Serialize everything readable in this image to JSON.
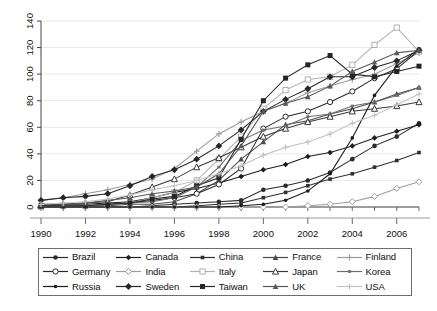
{
  "chart_data": {
    "type": "line",
    "title": "",
    "subtitle": "",
    "xlabel": "",
    "ylabel": "",
    "xlim": [
      1990,
      2007
    ],
    "ylim": [
      0,
      140
    ],
    "ytick_step": 20,
    "xtick_step": 2,
    "grid": true,
    "legend_position": "bottom",
    "yticks": [
      "0",
      "20",
      "40",
      "60",
      "80",
      "100",
      "120",
      "140"
    ],
    "xticks": [
      "1990",
      "1992",
      "1994",
      "1996",
      "1998",
      "2000",
      "2002",
      "2004",
      "2006"
    ],
    "x": [
      1990,
      1991,
      1992,
      1993,
      1994,
      1995,
      1996,
      1997,
      1998,
      1999,
      2000,
      2001,
      2002,
      2003,
      2004,
      2005,
      2006,
      2007
    ],
    "series": [
      {
        "name": "Brazil",
        "marker": "filled-circle",
        "color": "#2b2b2b",
        "values": [
          0,
          0,
          0,
          0,
          0,
          1,
          2,
          3,
          4,
          5,
          13,
          16,
          20,
          26,
          36,
          46,
          53,
          63
        ]
      },
      {
        "name": "Canada",
        "marker": "filled-diamond",
        "color": "#1f1f1f",
        "values": [
          2,
          2,
          2,
          3,
          4,
          7,
          11,
          14,
          18,
          23,
          28,
          32,
          38,
          41,
          46,
          52,
          57,
          62
        ]
      },
      {
        "name": "China",
        "marker": "filled-square-small",
        "color": "#303030",
        "values": [
          0,
          0,
          0,
          0,
          0,
          0,
          0,
          1,
          2,
          3,
          7,
          11,
          16,
          21,
          25,
          30,
          35,
          41
        ]
      },
      {
        "name": "France",
        "marker": "filled-triangle",
        "color": "#4a4a4a",
        "values": [
          0,
          1,
          1,
          1,
          2,
          2,
          4,
          10,
          20,
          36,
          49,
          62,
          65,
          70,
          74,
          79,
          85,
          90
        ]
      },
      {
        "name": "Finland",
        "marker": "plus",
        "color": "#9a9a9a",
        "values": [
          5,
          7,
          10,
          13,
          17,
          21,
          29,
          42,
          55,
          64,
          72,
          78,
          86,
          91,
          96,
          100,
          108,
          116
        ]
      },
      {
        "name": "Germany",
        "marker": "open-circle",
        "color": "#2a2a2a",
        "values": [
          0,
          1,
          1,
          2,
          3,
          5,
          7,
          10,
          17,
          29,
          59,
          68,
          72,
          79,
          87,
          97,
          104,
          118
        ]
      },
      {
        "name": "India",
        "marker": "open-diamond",
        "color": "#9d9d9d",
        "values": [
          0,
          0,
          0,
          0,
          0,
          0,
          0,
          0,
          0,
          0,
          0,
          0,
          1,
          2,
          4,
          8,
          14,
          19
        ]
      },
      {
        "name": "Italy",
        "marker": "open-square",
        "color": "#b0b0b0",
        "values": [
          0,
          1,
          1,
          2,
          3,
          7,
          11,
          20,
          36,
          53,
          74,
          88,
          96,
          98,
          107,
          122,
          135,
          117
        ]
      },
      {
        "name": "Japan",
        "marker": "open-triangle",
        "color": "#3a3a3a",
        "values": [
          1,
          2,
          3,
          4,
          9,
          15,
          21,
          30,
          37,
          45,
          53,
          59,
          64,
          68,
          72,
          74,
          76,
          79
        ]
      },
      {
        "name": "Korea",
        "marker": "small-dash",
        "color": "#6d6d6d",
        "values": [
          0,
          1,
          1,
          2,
          3,
          4,
          7,
          15,
          30,
          50,
          58,
          61,
          68,
          70,
          76,
          79,
          84,
          90
        ]
      },
      {
        "name": "Russia",
        "marker": "filled-circle-small",
        "color": "#1c1c1c",
        "values": [
          0,
          0,
          0,
          0,
          0,
          0,
          0,
          0,
          0,
          1,
          2,
          5,
          12,
          25,
          52,
          84,
          106,
          119
        ]
      },
      {
        "name": "Sweden",
        "marker": "filled-diamond-large",
        "color": "#262626",
        "values": [
          5,
          7,
          8,
          10,
          16,
          23,
          28,
          36,
          46,
          58,
          72,
          81,
          89,
          98,
          98,
          105,
          110,
          118
        ]
      },
      {
        "name": "Taiwan",
        "marker": "filled-square",
        "color": "#252525",
        "values": [
          1,
          1,
          1,
          2,
          3,
          6,
          8,
          16,
          22,
          51,
          80,
          97,
          107,
          114,
          100,
          98,
          102,
          106
        ]
      },
      {
        "name": "UK",
        "marker": "filled-triangle-gray",
        "color": "#585858",
        "values": [
          2,
          2,
          3,
          5,
          7,
          10,
          12,
          15,
          25,
          46,
          72,
          78,
          83,
          91,
          102,
          109,
          116,
          118
        ]
      },
      {
        "name": "USA",
        "marker": "light-plus",
        "color": "#c2c2c2",
        "values": [
          2,
          3,
          4,
          6,
          9,
          13,
          16,
          20,
          25,
          31,
          39,
          45,
          49,
          55,
          63,
          69,
          77,
          85
        ]
      }
    ]
  },
  "legend": {
    "items": [
      {
        "label": "Brazil"
      },
      {
        "label": "Canada"
      },
      {
        "label": "China"
      },
      {
        "label": "France"
      },
      {
        "label": "Finland"
      },
      {
        "label": "Germany"
      },
      {
        "label": "India"
      },
      {
        "label": "Italy"
      },
      {
        "label": "Japan"
      },
      {
        "label": "Korea"
      },
      {
        "label": "Russia"
      },
      {
        "label": "Sweden"
      },
      {
        "label": "Taiwan"
      },
      {
        "label": "UK"
      },
      {
        "label": "USA"
      }
    ]
  }
}
